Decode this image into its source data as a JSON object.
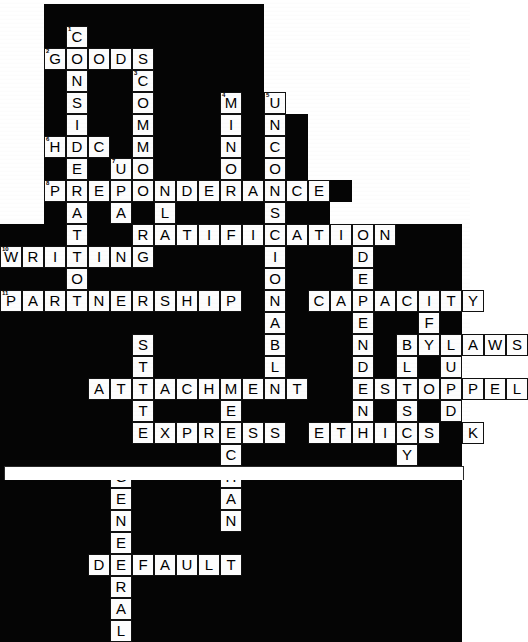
{
  "puzzle": {
    "title": "Legal Terms Crossword",
    "grid_columns": 21,
    "grid_rows": 20,
    "cell_size": 22,
    "colors": {
      "block": "#050505",
      "letter_fill": "#fdfdfd",
      "letter_text": "#000000",
      "page": "#ffffff"
    },
    "answers_across": [
      {
        "number": "2",
        "text": "GOODS",
        "row": 2,
        "col": 2
      },
      {
        "number": "",
        "text": "HDC",
        "row": 6,
        "col": 2
      },
      {
        "number": "9",
        "text": "PREPONDERANCE",
        "row": 8,
        "col": 2
      },
      {
        "number": "10",
        "text": "RATIFICATION",
        "row": 10,
        "col": 6
      },
      {
        "number": "",
        "text": "WRITING",
        "row": 11,
        "col": 0
      },
      {
        "number": "",
        "text": "DIRECTORS",
        "row": 11,
        "col": 13
      },
      {
        "number": "",
        "text": "PARTNERSHIP",
        "row": 13,
        "col": 0
      },
      {
        "number": "",
        "text": "CAPACITY",
        "row": 13,
        "col": 11
      },
      {
        "number": "",
        "text": "BYLAWS",
        "row": 15,
        "col": 17
      },
      {
        "number": "",
        "text": "ATTACHMENT",
        "row": 17,
        "col": 4
      },
      {
        "number": "",
        "text": "ESTOPPEL",
        "row": 17,
        "col": 13
      },
      {
        "number": "",
        "text": "EXPRESS",
        "row": 19,
        "col": 6
      },
      {
        "number": "",
        "text": "ETHICS",
        "row": 19,
        "col": 12
      },
      {
        "number": "",
        "text": "DEFAULT",
        "row": 25,
        "col": 4
      }
    ],
    "answers_down": [
      {
        "text": "CONSIDERATION",
        "row": 1,
        "col": 3
      },
      {
        "text": "COMMON",
        "row": 3,
        "col": 6
      },
      {
        "text": "MINOR",
        "row": 4,
        "col": 10
      },
      {
        "text": "UNCONSCIONABLE",
        "row": 4,
        "col": 12
      },
      {
        "text": "LAW",
        "row": 8,
        "col": 6
      },
      {
        "text": "FRAUD",
        "row": 14,
        "col": 19
      },
      {
        "text": "BLUESKY",
        "row": 15,
        "col": 17
      },
      {
        "text": "STATUTE",
        "row": 15,
        "col": 7
      },
      {
        "text": "MERCHANT",
        "row": 17,
        "col": 9
      },
      {
        "text": "GENERAL",
        "row": 21,
        "col": 5
      }
    ],
    "cells": [
      {
        "r": 0,
        "c": 2,
        "t": "block"
      },
      {
        "r": 0,
        "c": 3,
        "t": "block"
      },
      {
        "r": 0,
        "c": 4,
        "t": "block"
      },
      {
        "r": 0,
        "c": 5,
        "t": "block"
      },
      {
        "r": 0,
        "c": 6,
        "t": "block"
      },
      {
        "r": 0,
        "c": 7,
        "t": "block"
      },
      {
        "r": 0,
        "c": 8,
        "t": "block"
      },
      {
        "r": 0,
        "c": 9,
        "t": "block"
      },
      {
        "r": 0,
        "c": 10,
        "t": "block"
      },
      {
        "r": 0,
        "c": 11,
        "t": "block"
      },
      {
        "r": 1,
        "c": 2,
        "t": "block"
      },
      {
        "r": 1,
        "c": 3,
        "t": "L",
        "n": "1"
      },
      {
        "r": 1,
        "c": 4,
        "t": "block"
      },
      {
        "r": 1,
        "c": 5,
        "t": "block"
      },
      {
        "r": 1,
        "c": 6,
        "t": "block"
      },
      {
        "r": 1,
        "c": 7,
        "t": "block"
      },
      {
        "r": 1,
        "c": 8,
        "t": "block"
      },
      {
        "r": 1,
        "c": 9,
        "t": "block"
      },
      {
        "r": 1,
        "c": 10,
        "t": "block"
      },
      {
        "r": 1,
        "c": 11,
        "t": "block"
      },
      {
        "r": 1,
        "c": 12,
        "t": "block"
      },
      {
        "r": 2,
        "c": 2,
        "t": "L",
        "n": "2"
      },
      {
        "r": 2,
        "c": 3,
        "t": "L"
      },
      {
        "r": 2,
        "c": 4,
        "t": "L"
      },
      {
        "r": 2,
        "c": 5,
        "t": "L"
      },
      {
        "r": 2,
        "c": 6,
        "t": "L"
      },
      {
        "r": 2,
        "c": 7,
        "t": "block"
      },
      {
        "r": 2,
        "c": 8,
        "t": "block"
      },
      {
        "r": 2,
        "c": 9,
        "t": "block"
      },
      {
        "r": 2,
        "c": 10,
        "t": "block"
      },
      {
        "r": 2,
        "c": 11,
        "t": "block"
      },
      {
        "r": 2,
        "c": 12,
        "t": "block"
      },
      {
        "r": 3,
        "c": 2,
        "t": "block"
      },
      {
        "r": 3,
        "c": 3,
        "t": "L"
      },
      {
        "r": 3,
        "c": 4,
        "t": "block"
      },
      {
        "r": 3,
        "c": 5,
        "t": "block"
      },
      {
        "r": 3,
        "c": 6,
        "t": "L",
        "n": "3"
      },
      {
        "r": 3,
        "c": 7,
        "t": "block"
      },
      {
        "r": 3,
        "c": 8,
        "t": "block"
      },
      {
        "r": 3,
        "c": 9,
        "t": "block"
      },
      {
        "r": 3,
        "c": 10,
        "t": "block"
      },
      {
        "r": 3,
        "c": 11,
        "t": "block"
      },
      {
        "r": 3,
        "c": 12,
        "t": "block"
      },
      {
        "r": 4,
        "c": 2,
        "t": "block"
      },
      {
        "r": 4,
        "c": 3,
        "t": "L"
      },
      {
        "r": 4,
        "c": 4,
        "t": "block"
      },
      {
        "r": 4,
        "c": 5,
        "t": "block"
      },
      {
        "r": 4,
        "c": 6,
        "t": "L"
      },
      {
        "r": 4,
        "c": 7,
        "t": "block"
      },
      {
        "r": 4,
        "c": 8,
        "t": "block"
      },
      {
        "r": 4,
        "c": 9,
        "t": "block"
      },
      {
        "r": 4,
        "c": 10,
        "t": "L",
        "n": "4"
      },
      {
        "r": 4,
        "c": 11,
        "t": "block"
      },
      {
        "r": 4,
        "c": 12,
        "t": "L",
        "n": "5"
      },
      {
        "r": 5,
        "c": 2,
        "t": "block"
      },
      {
        "r": 5,
        "c": 3,
        "t": "L"
      },
      {
        "r": 5,
        "c": 4,
        "t": "block"
      },
      {
        "r": 5,
        "c": 5,
        "t": "block"
      },
      {
        "r": 5,
        "c": 6,
        "t": "L"
      },
      {
        "r": 5,
        "c": 7,
        "t": "block"
      },
      {
        "r": 5,
        "c": 8,
        "t": "block"
      },
      {
        "r": 5,
        "c": 9,
        "t": "block"
      },
      {
        "r": 5,
        "c": 10,
        "t": "L"
      },
      {
        "r": 5,
        "c": 11,
        "t": "block"
      },
      {
        "r": 5,
        "c": 12,
        "t": "L"
      },
      {
        "r": 5,
        "c": 13,
        "t": "block"
      },
      {
        "r": 6,
        "c": 2,
        "t": "L",
        "n": "6"
      },
      {
        "r": 6,
        "c": 3,
        "t": "L"
      },
      {
        "r": 6,
        "c": 4,
        "t": "L"
      },
      {
        "r": 6,
        "c": 5,
        "t": "block"
      },
      {
        "r": 6,
        "c": 6,
        "t": "L"
      },
      {
        "r": 6,
        "c": 7,
        "t": "block"
      },
      {
        "r": 6,
        "c": 8,
        "t": "block"
      },
      {
        "r": 6,
        "c": 9,
        "t": "block"
      },
      {
        "r": 6,
        "c": 10,
        "t": "L"
      },
      {
        "r": 6,
        "c": 11,
        "t": "block"
      },
      {
        "r": 6,
        "c": 12,
        "t": "L"
      },
      {
        "r": 6,
        "c": 13,
        "t": "block"
      },
      {
        "r": 7,
        "c": 2,
        "t": "block"
      },
      {
        "r": 7,
        "c": 3,
        "t": "L"
      },
      {
        "r": 7,
        "c": 4,
        "t": "block"
      },
      {
        "r": 7,
        "c": 5,
        "t": "L",
        "n": "7"
      },
      {
        "r": 7,
        "c": 6,
        "t": "L"
      },
      {
        "r": 7,
        "c": 7,
        "t": "block"
      },
      {
        "r": 7,
        "c": 8,
        "t": "block"
      },
      {
        "r": 7,
        "c": 9,
        "t": "block"
      },
      {
        "r": 7,
        "c": 10,
        "t": "L"
      },
      {
        "r": 7,
        "c": 11,
        "t": "block"
      },
      {
        "r": 7,
        "c": 12,
        "t": "L"
      },
      {
        "r": 7,
        "c": 13,
        "t": "block"
      },
      {
        "r": 8,
        "c": 2,
        "t": "L",
        "n": "8"
      },
      {
        "r": 8,
        "c": 3,
        "t": "L"
      },
      {
        "r": 8,
        "c": 4,
        "t": "L"
      },
      {
        "r": 8,
        "c": 5,
        "t": "L"
      },
      {
        "r": 8,
        "c": 6,
        "t": "L"
      },
      {
        "r": 8,
        "c": 7,
        "t": "L"
      },
      {
        "r": 8,
        "c": 8,
        "t": "L"
      },
      {
        "r": 8,
        "c": 9,
        "t": "L"
      },
      {
        "r": 8,
        "c": 10,
        "t": "L"
      },
      {
        "r": 8,
        "c": 11,
        "t": "L"
      },
      {
        "r": 8,
        "c": 12,
        "t": "L"
      },
      {
        "r": 8,
        "c": 13,
        "t": "L"
      },
      {
        "r": 8,
        "c": 14,
        "t": "L"
      },
      {
        "r": 9,
        "c": 2,
        "t": "block"
      },
      {
        "r": 9,
        "c": 3,
        "t": "L"
      },
      {
        "r": 9,
        "c": 4,
        "t": "block"
      },
      {
        "r": 9,
        "c": 5,
        "t": "L"
      },
      {
        "r": 9,
        "c": 6,
        "t": "block"
      },
      {
        "r": 9,
        "c": 7,
        "t": "L"
      },
      {
        "r": 9,
        "c": 8,
        "t": "block"
      },
      {
        "r": 9,
        "c": 9,
        "t": "block"
      },
      {
        "r": 9,
        "c": 10,
        "t": "block"
      },
      {
        "r": 9,
        "c": 11,
        "t": "block"
      },
      {
        "r": 9,
        "c": 12,
        "t": "L"
      },
      {
        "r": 9,
        "c": 13,
        "t": "block"
      },
      {
        "r": 9,
        "c": 14,
        "t": "block"
      },
      {
        "r": 10,
        "c": 0,
        "t": "block"
      },
      {
        "r": 10,
        "c": 1,
        "t": "block"
      },
      {
        "r": 10,
        "c": 2,
        "t": "block"
      },
      {
        "r": 10,
        "c": 3,
        "t": "L"
      },
      {
        "r": 10,
        "c": 4,
        "t": "block"
      },
      {
        "r": 10,
        "c": 5,
        "t": "L",
        "n": "9"
      },
      {
        "r": 10,
        "c": 6,
        "t": "L"
      },
      {
        "r": 10,
        "c": 7,
        "t": "L"
      },
      {
        "r": 10,
        "c": 8,
        "t": "L"
      },
      {
        "r": 10,
        "c": 9,
        "t": "L"
      },
      {
        "r": 10,
        "c": 10,
        "t": "L"
      },
      {
        "r": 10,
        "c": 11,
        "t": "L"
      },
      {
        "r": 10,
        "c": 12,
        "t": "L"
      },
      {
        "r": 10,
        "c": 13,
        "t": "L"
      },
      {
        "r": 10,
        "c": 14,
        "t": "L"
      },
      {
        "r": 10,
        "c": 15,
        "t": "L"
      },
      {
        "r": 10,
        "c": 16,
        "t": "L"
      },
      {
        "r": 11,
        "c": 0,
        "t": "L",
        "n": "10"
      },
      {
        "r": 11,
        "c": 1,
        "t": "L"
      },
      {
        "r": 11,
        "c": 2,
        "t": "L"
      },
      {
        "r": 11,
        "c": 3,
        "t": "L"
      },
      {
        "r": 11,
        "c": 4,
        "t": "L"
      },
      {
        "r": 11,
        "c": 5,
        "t": "L"
      },
      {
        "r": 11,
        "c": 6,
        "t": "L"
      },
      {
        "r": 11,
        "c": 7,
        "t": "block"
      },
      {
        "r": 11,
        "c": 8,
        "t": "block"
      },
      {
        "r": 11,
        "c": 9,
        "t": "block"
      },
      {
        "r": 11,
        "c": 10,
        "t": "block"
      },
      {
        "r": 11,
        "c": 11,
        "t": "block"
      },
      {
        "r": 11,
        "c": 12,
        "t": "L"
      },
      {
        "r": 11,
        "c": 13,
        "t": "block"
      },
      {
        "r": 11,
        "c": 14,
        "t": "block"
      },
      {
        "r": 12,
        "c": 0,
        "t": "block"
      },
      {
        "r": 12,
        "c": 1,
        "t": "block"
      },
      {
        "r": 12,
        "c": 2,
        "t": "block"
      },
      {
        "r": 12,
        "c": 3,
        "t": "L"
      },
      {
        "r": 12,
        "c": 4,
        "t": "block"
      },
      {
        "r": 12,
        "c": 5,
        "t": "block"
      },
      {
        "r": 12,
        "c": 6,
        "t": "block"
      },
      {
        "r": 12,
        "c": 7,
        "t": "block"
      },
      {
        "r": 12,
        "c": 8,
        "t": "block"
      },
      {
        "r": 12,
        "c": 9,
        "t": "block"
      },
      {
        "r": 12,
        "c": 10,
        "t": "block"
      },
      {
        "r": 12,
        "c": 11,
        "t": "block"
      },
      {
        "r": 12,
        "c": 12,
        "t": "L"
      },
      {
        "r": 12,
        "c": 13,
        "t": "block"
      },
      {
        "r": 13,
        "c": 0,
        "t": "L",
        "n": "11"
      },
      {
        "r": 13,
        "c": 1,
        "t": "L"
      },
      {
        "r": 13,
        "c": 2,
        "t": "L"
      },
      {
        "r": 13,
        "c": 3,
        "t": "L"
      },
      {
        "r": 13,
        "c": 4,
        "t": "L"
      },
      {
        "r": 13,
        "c": 5,
        "t": "L"
      },
      {
        "r": 13,
        "c": 6,
        "t": "L"
      },
      {
        "r": 13,
        "c": 7,
        "t": "L"
      },
      {
        "r": 13,
        "c": 8,
        "t": "L"
      },
      {
        "r": 13,
        "c": 9,
        "t": "L"
      },
      {
        "r": 13,
        "c": 10,
        "t": "L"
      },
      {
        "r": 13,
        "c": 11,
        "t": "block"
      },
      {
        "r": 13,
        "c": 12,
        "t": "L"
      },
      {
        "r": 13,
        "c": 13,
        "t": "block"
      }
    ]
  },
  "grid_map": {
    "note": "rows are strings of 21 chars; '#' = block, '.' = empty page, letters = filled cells",
    "rows": [
      "..##########.........",
      "..#C########.........",
      "..GOODS#####.........",
      "..#N##C#####.........",
      "..#S##O###M#U........",
      "..#I##M###I#N#.......",
      "..HDC#M###N#C#.......",
      "..#E#UO###O#O#.......",
      "..PREPONDERANCE#.....",
      "..#A#A#L####S##......",
      "###T##RATIFICATION###",
      "WRITING#####I###D####",
      "###O########O###E####",
      "PARTNERSHIP#N#CAPACITY",
      "############A###E##F#",
      "######S#####B###N#BYLAWS",
      "######T#####L###D#L#U",
      "####ATTACHMENT##ESTOPPEL",
      "######T###E#####N#S#D",
      "######EXPRESS#ETHICS#K",
      "##########C#######Y##",
      "#####G####H##########",
      "#####E####A##########",
      "#####N####N##########",
      "#####E###############",
      "####DEFAULT##########",
      "#####R###############",
      "#####A###############",
      "#####L###############"
    ]
  },
  "numbering": {
    "visible_small_numbers": [
      "1",
      "2",
      "3",
      "4",
      "5",
      "6",
      "7",
      "8",
      "9",
      "10",
      "11"
    ]
  },
  "footer": {
    "rule_present": true
  }
}
